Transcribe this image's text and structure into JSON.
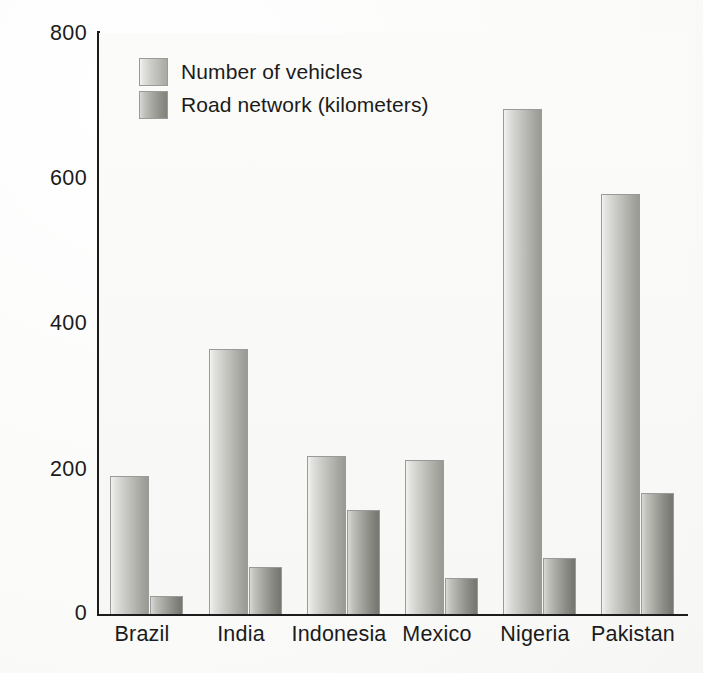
{
  "chart_data": {
    "type": "bar",
    "title": "",
    "xlabel": "",
    "ylabel": "% Total growth",
    "ylim": [
      0,
      800
    ],
    "yticks": [
      0,
      200,
      400,
      600,
      800
    ],
    "grid": false,
    "legend_position": "top-left",
    "categories": [
      "Brazil",
      "India",
      "Indonesia",
      "Mexico",
      "Nigeria",
      "Pakistan"
    ],
    "series": [
      {
        "name": "Number of vehicles",
        "color": "#bdbdb8",
        "values": [
          190,
          365,
          218,
          212,
          695,
          578
        ]
      },
      {
        "name": "Road network (kilometers)",
        "color": "#8e8e88",
        "values": [
          25,
          65,
          143,
          50,
          77,
          167
        ]
      }
    ]
  },
  "axis": {
    "tick_labels": [
      "800",
      "600",
      "400",
      "200",
      "0"
    ],
    "y_title": "% Total growth"
  },
  "legend": {
    "items": [
      {
        "label": "Number of vehicles"
      },
      {
        "label": "Road network (kilometers)"
      }
    ]
  },
  "colors": {
    "axis": "#1c1c1c",
    "text": "#1b1b1b",
    "plot_background": "#f8f8f6",
    "series_vehicles": "#bdbdb8",
    "series_road": "#8e8e88"
  }
}
